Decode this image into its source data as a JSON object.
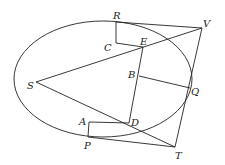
{
  "labels": {
    "R": "R",
    "V": "V",
    "C": "C",
    "E": "E",
    "B": "B",
    "S": "S",
    "Q": "Q",
    "A": "A",
    "D": "D",
    "P": "P",
    "T": "T"
  },
  "colors": {
    "stroke": "#222222",
    "background": "#ffffff"
  }
}
